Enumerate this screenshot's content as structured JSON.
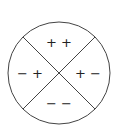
{
  "diagram": {
    "shape": "circle divided into four quadrants by two diagonal lines",
    "stroke_color": "#444444",
    "background": "#ffffff",
    "quadrants": {
      "top": "+ +",
      "left": "− +",
      "right": "+ −",
      "bottom": "− −"
    }
  }
}
